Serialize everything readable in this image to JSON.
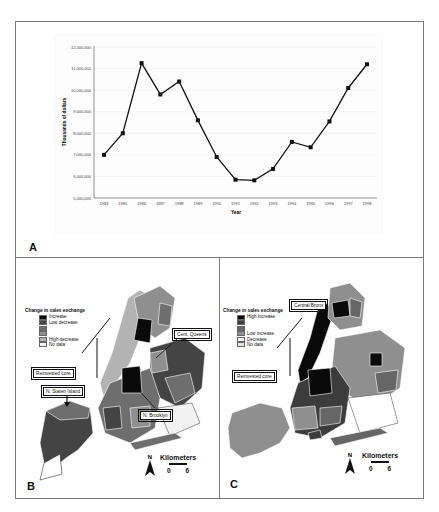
{
  "chart_data": {
    "type": "line",
    "title": "",
    "xlabel": "Year",
    "ylabel": "Thousands of dollars",
    "ylim": [
      5000000,
      12000000
    ],
    "grid": true,
    "legend": "none",
    "y_ticks": [
      "5,000,000",
      "6,000,000",
      "7,000,000",
      "8,000,000",
      "9,000,000",
      "10,000,000",
      "11,000,000",
      "12,000,000"
    ],
    "categories": [
      "1984",
      "1985",
      "1986",
      "1987",
      "1988",
      "1989",
      "1990",
      "1991",
      "1992",
      "1993",
      "1994",
      "1995",
      "1996",
      "1997",
      "1998"
    ],
    "series": [
      {
        "name": "Sales exchange",
        "values": [
          7000000,
          8000000,
          11250000,
          9800000,
          10400000,
          8600000,
          6900000,
          5850000,
          5820000,
          6350000,
          7600000,
          7350000,
          8550000,
          10100000,
          11200000
        ]
      }
    ]
  },
  "panels": {
    "a": {
      "letter": "A"
    },
    "b": {
      "letter": "B",
      "legend_title": "Change in sales exchange",
      "legend_items": [
        {
          "label": "Increase",
          "color": "#0a0a0a"
        },
        {
          "label": "Low decrease",
          "color": "#454545"
        },
        {
          "label": "",
          "color": "#6e6e6e"
        },
        {
          "label": "",
          "color": "#8f8f8f"
        },
        {
          "label": "High decrease",
          "color": "#b3b3b3"
        },
        {
          "label": "No data",
          "color": "#f2f2f2"
        }
      ],
      "callouts": [
        "Cent. Queens",
        "Reinvested core",
        "N. Staten Island",
        "N. Brooklyn"
      ],
      "north": "N",
      "scale_title": "Kilometers",
      "scale_min": "0",
      "scale_max": "6"
    },
    "c": {
      "letter": "C",
      "legend_title": "Change in sales exchange",
      "legend_items": [
        {
          "label": "High increase",
          "color": "#0a0a0a"
        },
        {
          "label": "",
          "color": "#3c3c3c"
        },
        {
          "label": "",
          "color": "#666666"
        },
        {
          "label": "Low increase",
          "color": "#8f8f8f"
        },
        {
          "label": "Decrease",
          "color": "#ffffff"
        },
        {
          "label": "No data",
          "color": "#e3e3e3"
        }
      ],
      "callouts": [
        "Central Bronx",
        "Reinvested core"
      ],
      "north": "N",
      "scale_title": "Kilometers",
      "scale_min": "0",
      "scale_max": "6"
    }
  }
}
